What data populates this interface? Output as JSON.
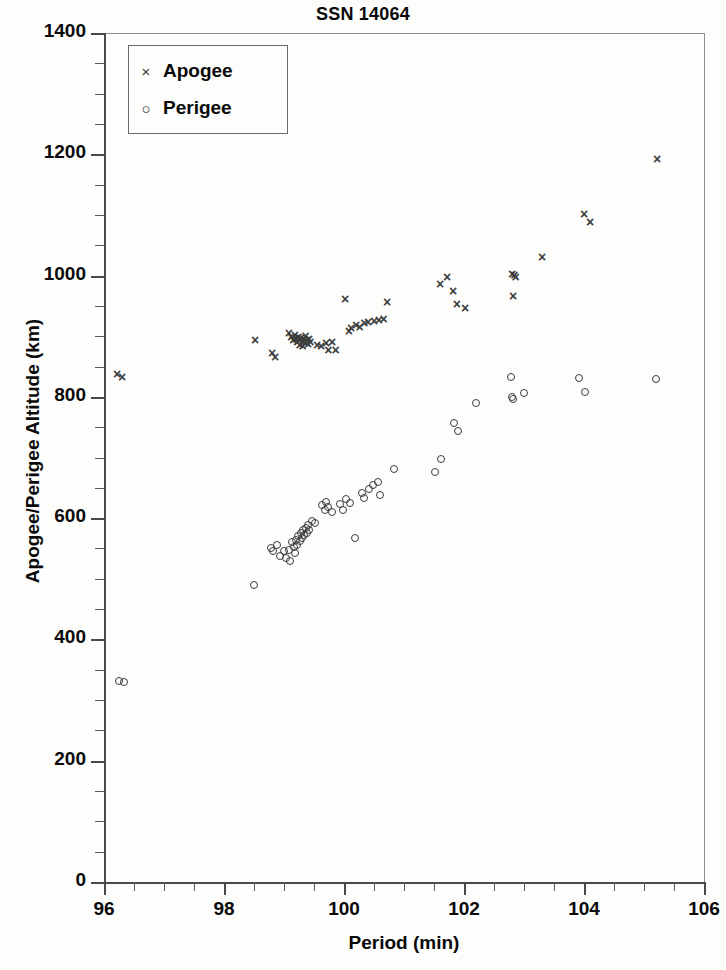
{
  "chart_data": {
    "type": "scatter",
    "title": "SSN 14064",
    "xlabel": "Period (min)",
    "ylabel": "Apogee/Perigee Altitude (km)",
    "xlim": [
      96,
      106
    ],
    "ylim": [
      0,
      1400
    ],
    "xticks": [
      96,
      98,
      100,
      102,
      104,
      106
    ],
    "xtick_labels": [
      "96",
      "98",
      "100",
      "102",
      "104",
      "106"
    ],
    "x_minor_interval": 0.5,
    "yticks": [
      0,
      200,
      400,
      600,
      800,
      1000,
      1200,
      1400
    ],
    "ytick_labels": [
      "0",
      "200",
      "400",
      "600",
      "800",
      "1000",
      "1200",
      "1400"
    ],
    "y_minor_interval": 50,
    "grid": false,
    "legend_position": "upper left",
    "series": [
      {
        "name": "Apogee",
        "marker": "x",
        "color": "#3c3c3c",
        "points": [
          [
            96.22,
            838
          ],
          [
            96.3,
            833
          ],
          [
            98.52,
            893
          ],
          [
            98.8,
            872
          ],
          [
            98.85,
            866
          ],
          [
            99.08,
            905
          ],
          [
            99.12,
            898
          ],
          [
            99.15,
            893
          ],
          [
            99.18,
            902
          ],
          [
            99.2,
            896
          ],
          [
            99.22,
            890
          ],
          [
            99.24,
            899
          ],
          [
            99.25,
            893
          ],
          [
            99.26,
            886
          ],
          [
            99.28,
            897
          ],
          [
            99.3,
            891
          ],
          [
            99.31,
            884
          ],
          [
            99.33,
            895
          ],
          [
            99.35,
            889
          ],
          [
            99.36,
            900
          ],
          [
            99.38,
            893
          ],
          [
            99.4,
            887
          ],
          [
            99.42,
            896
          ],
          [
            99.44,
            890
          ],
          [
            99.55,
            886
          ],
          [
            99.62,
            884
          ],
          [
            99.7,
            888
          ],
          [
            99.74,
            877
          ],
          [
            99.8,
            890
          ],
          [
            99.86,
            878
          ],
          [
            100.02,
            961
          ],
          [
            100.08,
            909
          ],
          [
            100.12,
            914
          ],
          [
            100.2,
            918
          ],
          [
            100.26,
            916
          ],
          [
            100.34,
            921
          ],
          [
            100.4,
            923
          ],
          [
            100.5,
            925
          ],
          [
            100.58,
            927
          ],
          [
            100.66,
            929
          ],
          [
            100.72,
            957
          ],
          [
            101.6,
            986
          ],
          [
            101.72,
            998
          ],
          [
            101.82,
            975
          ],
          [
            101.88,
            953
          ],
          [
            102.02,
            946
          ],
          [
            102.8,
            1003
          ],
          [
            102.84,
            1001
          ],
          [
            102.86,
            998
          ],
          [
            102.82,
            966
          ],
          [
            103.3,
            1030
          ],
          [
            104.0,
            1102
          ],
          [
            104.1,
            1089
          ],
          [
            105.22,
            1192
          ]
        ]
      },
      {
        "name": "Perigee",
        "marker": "o",
        "color": "#3c3c3c",
        "points": [
          [
            96.25,
            331
          ],
          [
            96.33,
            330
          ],
          [
            98.5,
            490
          ],
          [
            98.78,
            551
          ],
          [
            98.82,
            546
          ],
          [
            98.88,
            556
          ],
          [
            98.94,
            538
          ],
          [
            99.0,
            545
          ],
          [
            99.04,
            534
          ],
          [
            99.08,
            548
          ],
          [
            99.1,
            530
          ],
          [
            99.14,
            560
          ],
          [
            99.16,
            552
          ],
          [
            99.18,
            543
          ],
          [
            99.2,
            564
          ],
          [
            99.22,
            556
          ],
          [
            99.24,
            570
          ],
          [
            99.26,
            562
          ],
          [
            99.28,
            575
          ],
          [
            99.3,
            567
          ],
          [
            99.32,
            580
          ],
          [
            99.34,
            572
          ],
          [
            99.36,
            584
          ],
          [
            99.38,
            576
          ],
          [
            99.4,
            588
          ],
          [
            99.42,
            580
          ],
          [
            99.46,
            595
          ],
          [
            99.52,
            592
          ],
          [
            99.64,
            621
          ],
          [
            99.68,
            614
          ],
          [
            99.7,
            627
          ],
          [
            99.74,
            618
          ],
          [
            99.8,
            610
          ],
          [
            99.94,
            623
          ],
          [
            99.98,
            614
          ],
          [
            100.04,
            631
          ],
          [
            100.1,
            625
          ],
          [
            100.18,
            568
          ],
          [
            100.3,
            641
          ],
          [
            100.34,
            634
          ],
          [
            100.42,
            648
          ],
          [
            100.48,
            655
          ],
          [
            100.56,
            660
          ],
          [
            100.6,
            638
          ],
          [
            100.84,
            681
          ],
          [
            101.52,
            676
          ],
          [
            101.62,
            697
          ],
          [
            101.84,
            757
          ],
          [
            101.9,
            743
          ],
          [
            102.2,
            790
          ],
          [
            102.78,
            833
          ],
          [
            102.8,
            800
          ],
          [
            102.82,
            796
          ],
          [
            103.0,
            806
          ],
          [
            103.92,
            831
          ],
          [
            104.02,
            808
          ],
          [
            105.2,
            830
          ]
        ]
      }
    ]
  },
  "legend": {
    "entries": [
      {
        "label": "Apogee",
        "marker": "×"
      },
      {
        "label": "Perigee",
        "marker": "○"
      }
    ]
  },
  "colors": {
    "axis": "#4a4a4a",
    "marker": "#3c3c3c",
    "text": "#0a0a0a",
    "background": "#fdfdfc"
  }
}
